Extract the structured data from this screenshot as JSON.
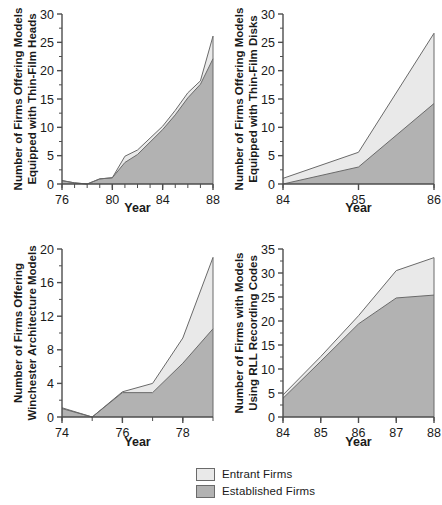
{
  "legend": {
    "items": [
      {
        "label": "Entrant Firms",
        "color": "#e9e9e9"
      },
      {
        "label": "Established Firms",
        "color": "#b2b2b2"
      }
    ]
  },
  "colors": {
    "entrant_fill": "#e9e9e9",
    "established_fill": "#b2b2b2",
    "line": "#6a6a6a",
    "axis": "#4d4d4d",
    "text": "#1a1a1a",
    "background": "#ffffff"
  },
  "chart_data": [
    {
      "type": "area",
      "id": "thin-film-heads",
      "title": "",
      "xlabel": "Year",
      "ylabel": "Number of Firms Offering Models Equipped with Thin-Film Heads",
      "ylabel_lines": [
        "Number of Firms Offering Models",
        "Equipped with Thin-Film Heads"
      ],
      "stacked": true,
      "grid": false,
      "legend_position": "bottom",
      "x": [
        76,
        77,
        78,
        79,
        80,
        81,
        82,
        83,
        84,
        85,
        86,
        87,
        88
      ],
      "xlim": [
        76,
        88
      ],
      "ylim": [
        0,
        30
      ],
      "xticks": [
        76,
        80,
        84,
        88
      ],
      "xtick_labels": [
        "76",
        "80",
        "84",
        "88"
      ],
      "xminor_ticks": [
        76,
        77,
        78,
        79,
        80,
        81,
        82,
        83,
        84,
        85,
        86,
        87,
        88
      ],
      "yticks": [
        0,
        5,
        10,
        15,
        20,
        25,
        30
      ],
      "ytick_labels": [
        "0",
        "5",
        "10",
        "15",
        "20",
        "25",
        "30"
      ],
      "series": [
        {
          "name": "Established Firms",
          "values": [
            0.6,
            0.2,
            0,
            0.9,
            1.1,
            3.8,
            5.2,
            7.4,
            9.6,
            12.2,
            15.2,
            17.6,
            22.1
          ]
        },
        {
          "name": "Entrant Firms",
          "values": [
            0,
            0,
            0,
            0,
            0,
            1.1,
            0.8,
            0.7,
            0.6,
            0.8,
            0.9,
            0.6,
            4.0
          ]
        }
      ],
      "totals": [
        0.6,
        0.2,
        0,
        0.9,
        1.1,
        4.9,
        6.0,
        8.1,
        10.2,
        13.0,
        16.1,
        18.2,
        26.1
      ]
    },
    {
      "type": "area",
      "id": "thin-film-disks",
      "title": "",
      "xlabel": "Year",
      "ylabel": "Number of Firms Offering Models Equipped with Thin-Film Disks",
      "ylabel_lines": [
        "Number of Firms Offering Models",
        "Equipped with Thin-Film Disks"
      ],
      "stacked": true,
      "grid": false,
      "legend_position": "bottom",
      "x": [
        84,
        85,
        86
      ],
      "xlim": [
        84,
        86
      ],
      "ylim": [
        0,
        30
      ],
      "xticks": [
        84,
        85,
        86
      ],
      "xtick_labels": [
        "84",
        "85",
        "86"
      ],
      "xminor_ticks": [
        84,
        85,
        86
      ],
      "yticks": [
        0,
        5,
        10,
        15,
        20,
        25,
        30
      ],
      "ytick_labels": [
        "0",
        "5",
        "10",
        "15",
        "20",
        "25",
        "30"
      ],
      "series": [
        {
          "name": "Established Firms",
          "values": [
            0,
            3.0,
            14.2
          ]
        },
        {
          "name": "Entrant Firms",
          "values": [
            1.0,
            2.6,
            12.4
          ]
        }
      ],
      "totals": [
        1.0,
        5.6,
        26.6
      ]
    },
    {
      "type": "area",
      "id": "winchester-architecture",
      "title": "",
      "xlabel": "Year",
      "ylabel": "Number of Firms Offering Winchester Architecture Models",
      "ylabel_lines": [
        "Number of Firms Offering",
        "Winchester Architecture Models"
      ],
      "stacked": true,
      "grid": false,
      "legend_position": "bottom",
      "x": [
        74,
        75,
        76,
        77,
        78,
        79
      ],
      "xlim": [
        74,
        79
      ],
      "ylim": [
        0,
        20
      ],
      "xticks": [
        74,
        76,
        78
      ],
      "xtick_labels": [
        "74",
        "76",
        "78"
      ],
      "xminor_ticks": [
        74,
        75,
        76,
        77,
        78,
        79
      ],
      "yticks": [
        0,
        4,
        8,
        12,
        16,
        20
      ],
      "ytick_labels": [
        "0",
        "4",
        "8",
        "12",
        "16",
        "20"
      ],
      "series": [
        {
          "name": "Established Firms",
          "values": [
            1.0,
            0,
            2.9,
            2.9,
            6.4,
            10.5
          ]
        },
        {
          "name": "Entrant Firms",
          "values": [
            0.1,
            0,
            0.1,
            1.1,
            3.0,
            8.5
          ]
        }
      ],
      "totals": [
        1.1,
        0,
        3.0,
        4.0,
        9.4,
        19.0
      ]
    },
    {
      "type": "area",
      "id": "rll-recording-codes",
      "title": "",
      "xlabel": "Year",
      "ylabel": "Number of Firms with Models Using RLL Recording Codes",
      "ylabel_lines": [
        "Number of Firms with Models",
        "Using RLL Recording Codes"
      ],
      "stacked": true,
      "grid": false,
      "legend_position": "bottom",
      "x": [
        84,
        85,
        86,
        87,
        88
      ],
      "xlim": [
        84,
        88
      ],
      "ylim": [
        0,
        35
      ],
      "xticks": [
        84,
        85,
        86,
        87,
        88
      ],
      "xtick_labels": [
        "84",
        "85",
        "86",
        "87",
        "88"
      ],
      "xminor_ticks": [
        84,
        85,
        86,
        87,
        88
      ],
      "yticks": [
        0,
        5,
        10,
        15,
        20,
        25,
        30,
        35
      ],
      "ytick_labels": [
        "0",
        "5",
        "10",
        "15",
        "20",
        "25",
        "30",
        "35"
      ],
      "series": [
        {
          "name": "Established Firms",
          "values": [
            3.9,
            11.6,
            19.4,
            24.8,
            25.4
          ]
        },
        {
          "name": "Entrant Firms",
          "values": [
            0.7,
            1.0,
            1.7,
            5.7,
            7.8
          ]
        }
      ],
      "totals": [
        4.6,
        12.6,
        21.1,
        30.5,
        33.2
      ]
    }
  ]
}
